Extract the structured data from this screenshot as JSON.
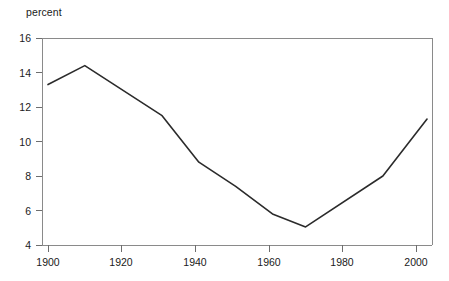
{
  "chart_data": {
    "type": "line",
    "title": "",
    "subtitle": "",
    "ylabel": "percent",
    "xlabel": "",
    "xlim": [
      1898,
      2006
    ],
    "ylim": [
      4,
      16
    ],
    "grid": false,
    "legend": "none",
    "y_ticks": [
      4,
      6,
      8,
      10,
      12,
      14,
      16
    ],
    "y_tick_labels": [
      "4",
      "6",
      "8",
      "10",
      "12",
      "14",
      "16"
    ],
    "x_ticks": [
      1900,
      1920,
      1940,
      1960,
      1980,
      2000
    ],
    "x_tick_labels": [
      "1900",
      "1920",
      "1940",
      "1960",
      "1980",
      "2000"
    ],
    "series": [
      {
        "name": "percent",
        "color": "#2b2b2b",
        "x": [
          1900,
          1910,
          1931,
          1941,
          1951,
          1961,
          1970,
          1991,
          2003
        ],
        "values": [
          13.3,
          14.4,
          11.5,
          8.8,
          7.4,
          5.8,
          5.05,
          8.0,
          11.3
        ]
      }
    ]
  },
  "axes": {
    "y_unit_label": "percent",
    "y_tick_0": "16",
    "y_tick_1": "14",
    "y_tick_2": "12",
    "y_tick_3": "10",
    "y_tick_4": "8",
    "y_tick_5": "6",
    "y_tick_6": "4",
    "x_tick_0": "1900",
    "x_tick_1": "1920",
    "x_tick_2": "1940",
    "x_tick_3": "1960",
    "x_tick_4": "1980",
    "x_tick_5": "2000"
  },
  "colors": {
    "line": "#2b2b2b",
    "frame": "#8a8a8a",
    "text": "#1a1a1a",
    "background": "#ffffff"
  }
}
